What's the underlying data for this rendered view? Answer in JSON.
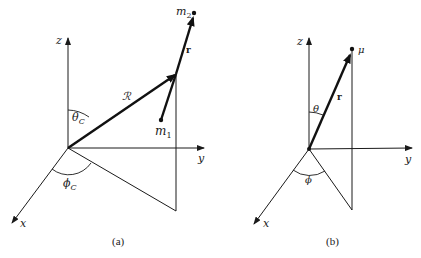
{
  "colors": {
    "ink": "#1a1a1a",
    "background": "#ffffff"
  },
  "panel_a": {
    "caption": "(a)",
    "axes": {
      "x": "x",
      "y": "y",
      "z": "z"
    },
    "vectors": {
      "R": "ℛ",
      "r": "r"
    },
    "points": {
      "m1": "m",
      "m1_sub": "1",
      "m2": "m",
      "m2_sub": "2"
    },
    "angles": {
      "theta": "θ",
      "theta_sub": "C",
      "phi": "ϕ",
      "phi_sub": "C"
    }
  },
  "panel_b": {
    "caption": "(b)",
    "axes": {
      "x": "x",
      "y": "y",
      "z": "z"
    },
    "vectors": {
      "r": "r"
    },
    "points": {
      "mu": "μ"
    },
    "angles": {
      "theta": "θ",
      "phi": "ϕ"
    }
  }
}
